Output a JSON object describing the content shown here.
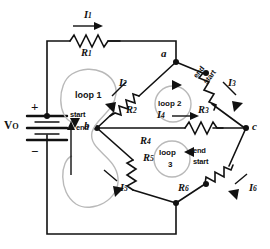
{
  "figure": {
    "type": "circuit-schematic",
    "background": "#ffffff",
    "wire_color": "#111111",
    "loop_color": "#b9b9b9"
  },
  "source": {
    "label_v": "V",
    "label_v_sub": "O",
    "plus": "+",
    "minus": "−"
  },
  "nodes": [
    {
      "id": "a",
      "label": "a"
    },
    {
      "id": "b",
      "label": "b"
    },
    {
      "id": "c",
      "label": "c"
    }
  ],
  "resistors": [
    {
      "id": "R1",
      "label": "R",
      "sub": "1"
    },
    {
      "id": "R2",
      "label": "R",
      "sub": "2"
    },
    {
      "id": "R3",
      "label": "R",
      "sub": "3"
    },
    {
      "id": "R4",
      "label": "R",
      "sub": "4"
    },
    {
      "id": "R5",
      "label": "R",
      "sub": "5"
    },
    {
      "id": "R6",
      "label": "R",
      "sub": "6"
    }
  ],
  "currents": [
    {
      "id": "I1",
      "label": "I",
      "sub": "1",
      "direction": "right"
    },
    {
      "id": "I2",
      "label": "I",
      "sub": "2",
      "direction": "down-left"
    },
    {
      "id": "I3",
      "label": "I",
      "sub": "3",
      "direction": "down-right"
    },
    {
      "id": "I4",
      "label": "I",
      "sub": "4",
      "direction": "right"
    },
    {
      "id": "I5",
      "label": "I",
      "sub": "5",
      "direction": "down-right"
    },
    {
      "id": "I6",
      "label": "I",
      "sub": "6",
      "direction": "down-left"
    }
  ],
  "loops": [
    {
      "id": "loop1",
      "label": "loop 1",
      "start": "start",
      "end": "end",
      "sense": "counterclockwise"
    },
    {
      "id": "loop2",
      "label": "loop 2",
      "start": "start",
      "end": "end",
      "sense": "clockwise"
    },
    {
      "id": "loop3",
      "label_line1": "loop",
      "label_line2": "3",
      "start": "start",
      "end": "end",
      "sense": "counterclockwise"
    }
  ]
}
